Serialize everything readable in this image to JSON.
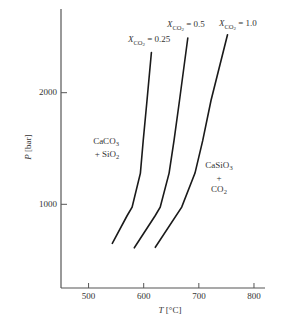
{
  "chart_data": {
    "type": "line",
    "title": "",
    "xlabel": "T [°C]",
    "ylabel": "P [bar]",
    "xlabel_var": "T",
    "xlabel_unit": " [°C]",
    "ylabel_var": "P",
    "ylabel_unit": " [bar]",
    "xlim": [
      450,
      820
    ],
    "ylim": [
      250,
      2750
    ],
    "grid": false,
    "legend": "none (curves labeled directly)",
    "x_ticks": [
      500,
      600,
      700,
      800
    ],
    "x_tick_labels": [
      "500",
      "600",
      "700",
      "800"
    ],
    "y_ticks": [
      1000,
      2000
    ],
    "y_tick_labels": [
      "1000",
      "2000"
    ],
    "series": [
      {
        "name": "X_CO2 = 0.25",
        "label_var": "X",
        "label_sub": "CO",
        "label_subsub": "2",
        "label_eq": " = 0.25",
        "points": [
          [
            543,
            650
          ],
          [
            570,
            900
          ],
          [
            579,
            975
          ],
          [
            594,
            1280
          ],
          [
            599,
            1570
          ],
          [
            606,
            1930
          ],
          [
            614,
            2360
          ]
        ]
      },
      {
        "name": "X_CO2 = 0.5",
        "label_var": "X",
        "label_sub": "CO",
        "label_subsub": "2",
        "label_eq": " = 0.5",
        "points": [
          [
            583,
            610
          ],
          [
            621,
            900
          ],
          [
            630,
            975
          ],
          [
            646,
            1280
          ],
          [
            655,
            1570
          ],
          [
            665,
            1930
          ],
          [
            680,
            2490
          ]
        ]
      },
      {
        "name": "X_CO2 = 1.0",
        "label_var": "X",
        "label_sub": "CO",
        "label_subsub": "2",
        "label_eq": " = 1.0",
        "points": [
          [
            621,
            615
          ],
          [
            669,
            975
          ],
          [
            693,
            1280
          ],
          [
            707,
            1570
          ],
          [
            722,
            1930
          ],
          [
            752,
            2520
          ]
        ]
      }
    ],
    "annotations": [
      {
        "region": "low-temperature side",
        "lines": [
          {
            "main": "CaCO",
            "sub": "3"
          },
          {
            "main": "+ SiO",
            "sub": "2"
          }
        ]
      },
      {
        "region": "high-temperature side",
        "lines": [
          {
            "main": "CaSiO",
            "sub": "3"
          },
          {
            "main": "+",
            "sub": ""
          },
          {
            "main": "CO",
            "sub": "2"
          }
        ]
      }
    ]
  }
}
